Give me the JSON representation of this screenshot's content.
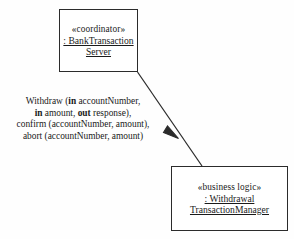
{
  "diagram": {
    "type": "uml-collaboration-diagram",
    "line_color": "#2b2b2b",
    "background_color": "#fefefe"
  },
  "nodes": {
    "coordinator": {
      "stereotype": "«coordinator»",
      "instance_line1": ": BankTransaction",
      "instance_line2": "Server"
    },
    "business_logic": {
      "stereotype": "«business logic»",
      "instance_line1": ": Withdrawal",
      "instance_line2": "TransactionManager"
    }
  },
  "link": {
    "arrow_style": "solid-filled-arrowhead",
    "direction": "coordinator-to-business-logic",
    "messages": {
      "line1_a": "Withdraw (",
      "line1_kw": "in",
      "line1_b": " accountNumber,",
      "line2_kw1": "in",
      "line2_a": " amount, ",
      "line2_kw2": "out",
      "line2_b": " response),",
      "line3": "confirm (accountNumber, amount),",
      "line4": "abort (accountNumber, amount)"
    }
  }
}
